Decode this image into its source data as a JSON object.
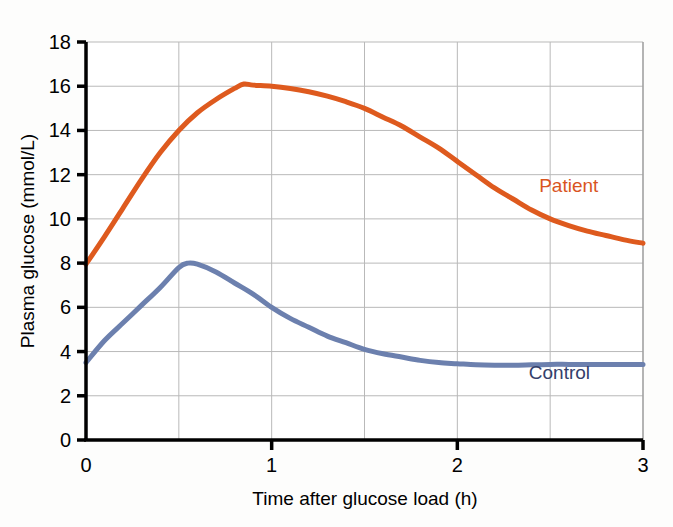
{
  "figure": {
    "background_color": "#fdfdfc",
    "plot_background_color": "#ffffff"
  },
  "chart_data": {
    "type": "line",
    "title": "",
    "xlabel": "Time after glucose load (h)",
    "ylabel": "Plasma glucose (mmol/L)",
    "xlim": [
      0,
      3
    ],
    "ylim": [
      0,
      18
    ],
    "xticks": [
      "0",
      "1",
      "2",
      "3"
    ],
    "xtick_values": [
      0,
      1,
      2,
      3
    ],
    "yticks": [
      "0",
      "2",
      "4",
      "6",
      "8",
      "10",
      "12",
      "14",
      "16",
      "18"
    ],
    "ytick_values": [
      0,
      2,
      4,
      6,
      8,
      10,
      12,
      14,
      16,
      18
    ],
    "grid": true,
    "grid_x_step": 0.5,
    "grid_y_step": 2,
    "legend_position": "inline-right",
    "series": [
      {
        "name": "Patient",
        "color": "#de5a1e",
        "label_x": 2.6,
        "label_y": 11.2,
        "x": [
          0,
          0.1,
          0.2,
          0.3,
          0.4,
          0.5,
          0.6,
          0.7,
          0.8,
          0.85,
          0.9,
          1.0,
          1.1,
          1.2,
          1.3,
          1.4,
          1.5,
          1.6,
          1.7,
          1.8,
          1.9,
          2.0,
          2.1,
          2.2,
          2.3,
          2.4,
          2.5,
          2.6,
          2.7,
          2.8,
          2.9,
          3.0
        ],
        "y": [
          7.95,
          9.2,
          10.5,
          11.8,
          13.0,
          14.0,
          14.8,
          15.4,
          15.9,
          16.1,
          16.05,
          16.0,
          15.9,
          15.75,
          15.55,
          15.3,
          15.0,
          14.6,
          14.2,
          13.7,
          13.2,
          12.6,
          12.0,
          11.4,
          10.9,
          10.4,
          10.0,
          9.7,
          9.45,
          9.25,
          9.05,
          8.9
        ]
      },
      {
        "name": "Control",
        "color": "#6c80ae",
        "label_x": 2.55,
        "label_y": 2.75,
        "x": [
          0,
          0.1,
          0.2,
          0.3,
          0.4,
          0.5,
          0.55,
          0.6,
          0.7,
          0.8,
          0.9,
          1.0,
          1.1,
          1.2,
          1.3,
          1.4,
          1.5,
          1.6,
          1.7,
          1.8,
          1.9,
          2.0,
          2.1,
          2.2,
          2.3,
          2.4,
          2.5,
          2.6,
          2.7,
          2.8,
          2.9,
          3.0
        ],
        "y": [
          3.5,
          4.5,
          5.3,
          6.1,
          6.9,
          7.8,
          8.0,
          7.95,
          7.6,
          7.1,
          6.6,
          6.0,
          5.5,
          5.1,
          4.7,
          4.4,
          4.1,
          3.9,
          3.75,
          3.6,
          3.5,
          3.45,
          3.4,
          3.38,
          3.38,
          3.4,
          3.42,
          3.42,
          3.42,
          3.42,
          3.42,
          3.42
        ]
      }
    ]
  }
}
